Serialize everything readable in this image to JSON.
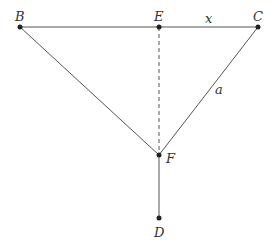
{
  "diagram": {
    "points": [
      {
        "id": "B",
        "label": "B",
        "x": 20,
        "y": 27,
        "lx": 17,
        "ly": 18
      },
      {
        "id": "E",
        "label": "E",
        "x": 159,
        "y": 27,
        "lx": 154,
        "ly": 18
      },
      {
        "id": "C",
        "label": "C",
        "x": 258,
        "y": 27,
        "lx": 254,
        "ly": 18
      },
      {
        "id": "F",
        "label": "F",
        "x": 159,
        "y": 155,
        "lx": 167,
        "ly": 163
      },
      {
        "id": "D",
        "label": "D",
        "x": 159,
        "y": 218,
        "lx": 154,
        "ly": 236
      }
    ],
    "segments": [
      {
        "from": "B",
        "to": "C",
        "style": "solid"
      },
      {
        "from": "B",
        "to": "F",
        "style": "solid"
      },
      {
        "from": "C",
        "to": "F",
        "style": "solid"
      },
      {
        "from": "F",
        "to": "D",
        "style": "solid"
      },
      {
        "from": "E",
        "to": "F",
        "style": "dashed"
      }
    ],
    "segment_labels": [
      {
        "text": "x",
        "x": 205,
        "y": 23
      },
      {
        "text": "a",
        "x": 215,
        "y": 94
      }
    ],
    "colors": {
      "line": "#555555",
      "point": "#222222",
      "label": "#333333"
    }
  }
}
